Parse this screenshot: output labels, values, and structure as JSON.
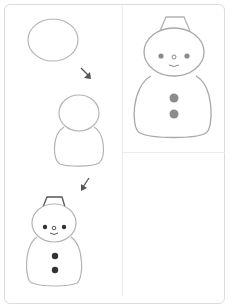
{
  "colors": {
    "outline": "#b4b4b4",
    "arrow": "#555555",
    "dark_dots": "#333333",
    "final_dots": "#8c8c8c",
    "border": "#dcdcdc"
  },
  "steps": [
    {
      "id": 1,
      "label": "head circle"
    },
    {
      "id": 2,
      "label": "add body"
    },
    {
      "id": 3,
      "label": "add hat, face and buttons"
    },
    {
      "id": 4,
      "label": "finished snowman"
    }
  ]
}
